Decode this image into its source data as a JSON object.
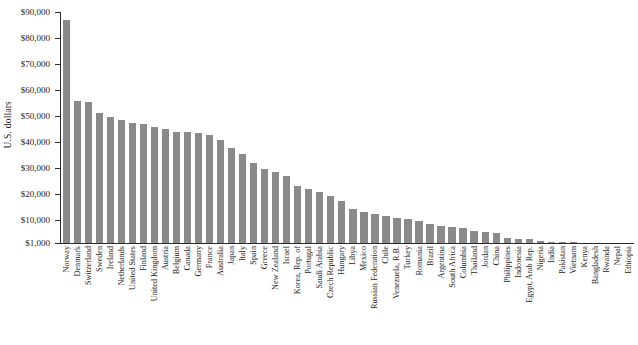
{
  "chart_data": {
    "type": "bar",
    "title": "",
    "xlabel": "",
    "ylabel": "U.S. dollars",
    "ylim": [
      1000,
      90000
    ],
    "grid": false,
    "legend": null,
    "bar_color": "#8a8a8a",
    "axis_color": "#2b2b2b",
    "ytick_labels": [
      "$90,000",
      "$80,000",
      "$70,000",
      "$60,000",
      "$50,000",
      "$40,000",
      "$30,000",
      "$20,000",
      "$10,000",
      "$1,000"
    ],
    "ytick_values": [
      90000,
      80000,
      70000,
      60000,
      50000,
      40000,
      30000,
      20000,
      10000,
      1000
    ],
    "categories": [
      "Norway",
      "Denmark",
      "Switzerland",
      "Sweden",
      "Ireland",
      "Netherlands",
      "United States",
      "Finland",
      "United Kingdom",
      "Austria",
      "Belgium",
      "Canada",
      "Germany",
      "France",
      "Australia",
      "Japan",
      "Italy",
      "Spain",
      "Greece",
      "New Zealand",
      "Israel",
      "Korea, Rep. of",
      "Portugal",
      "Saudi Arabia",
      "Czech Republic",
      "Hungary",
      "Libya",
      "Mexico",
      "Russian Federation",
      "Chile",
      "Venezuela, R.B.",
      "Turkey",
      "Romania",
      "Brazil",
      "Argentina",
      "South Africa",
      "Columbia",
      "Thailand",
      "Jordan",
      "China",
      "Philippines",
      "Indonesia",
      "Egypt, Arab Rep.",
      "Nigeria",
      "India",
      "Pakistan",
      "Vietnam",
      "Kenya",
      "Bangladesh",
      "Rwanda",
      "Nepal",
      "Ethiopia"
    ],
    "values": [
      87000,
      55800,
      55500,
      51000,
      49600,
      48400,
      47200,
      46800,
      45600,
      45100,
      43800,
      43600,
      43300,
      42500,
      40700,
      37800,
      35400,
      32000,
      29500,
      28300,
      26700,
      23000,
      21900,
      20500,
      19300,
      17200,
      14100,
      13000,
      12000,
      11500,
      10700,
      10300,
      9500,
      8400,
      7700,
      7200,
      6900,
      5600,
      5100,
      4800,
      2800,
      2700,
      2500,
      1600,
      1400,
      1200,
      1200,
      1000,
      850,
      700,
      600,
      450
    ]
  }
}
